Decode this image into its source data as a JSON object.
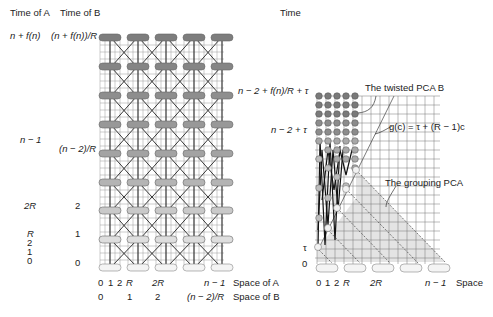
{
  "left": {
    "header_time_a": "Time of A",
    "header_time_b": "Time of B",
    "y_labels_a": [
      {
        "text": "n + f(n)",
        "y": 39
      },
      {
        "text": "n − 1",
        "y": 140
      },
      {
        "text": "2R",
        "y": 205
      },
      {
        "text": "R",
        "y": 234
      },
      {
        "text": "2",
        "y": 244
      },
      {
        "text": "1",
        "y": 254
      },
      {
        "text": "0",
        "y": 264
      }
    ],
    "y_labels_b": [
      {
        "text": "(n + f(n))/R",
        "y": 39
      },
      {
        "text": "(n − 2)/R",
        "y": 154
      },
      {
        "text": "2",
        "y": 205
      },
      {
        "text": "1",
        "y": 234
      },
      {
        "text": "0",
        "y": 264
      }
    ],
    "x_labels_a": [
      "0",
      "1",
      "2",
      "R",
      "2R",
      "n − 1"
    ],
    "x_labels_b": [
      "0",
      "1",
      "2",
      "(n − 2)/R"
    ],
    "axis_space_a": "Space of A",
    "axis_space_b": "Space of B"
  },
  "right": {
    "header_time": "Time",
    "y_labels": [
      {
        "text": "n − 2 + f(n)/R + τ",
        "y": 91
      },
      {
        "text": "n − 2 + τ",
        "y": 130
      },
      {
        "text": "τ",
        "y": 248
      },
      {
        "text": "0",
        "y": 264
      }
    ],
    "x_labels": [
      "0",
      "1",
      "2",
      "R",
      "2R",
      "n − 1"
    ],
    "axis_space": "Space",
    "annotation_twisted": "The twisted PCA  B",
    "annotation_g": "g(c) = τ + (R − 1)c",
    "annotation_grouping": "The grouping PCA"
  },
  "colors": {
    "dark_oval": "#7d7d7d",
    "mid_oval": "#a3a3a3",
    "light_oval": "#c9c9c9",
    "white_oval": "#f4f4f4",
    "grid_line": "#555555",
    "shade": "#e4e4e4"
  }
}
